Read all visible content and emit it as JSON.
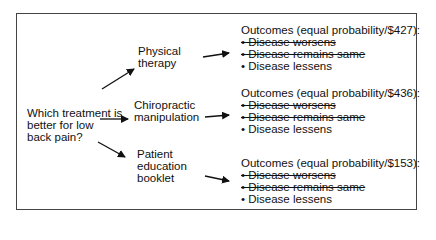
{
  "question": {
    "lines": [
      "Which treatment is",
      "better for low",
      "back pain?"
    ]
  },
  "options": [
    {
      "lines": [
        "Physical",
        "therapy"
      ],
      "outcomes": {
        "title": "Outcomes (equal probability/$427):",
        "items": [
          {
            "label": "• Disease worsens",
            "struck": true
          },
          {
            "label": "• Disease remains same",
            "struck": true
          },
          {
            "label": "• Disease lessens",
            "struck": false
          }
        ]
      }
    },
    {
      "lines": [
        "Chiropractic",
        "manipulation"
      ],
      "outcomes": {
        "title": "Outcomes (equal probability/$436):",
        "items": [
          {
            "label": "• Disease worsens",
            "struck": true
          },
          {
            "label": "• Disease remains same",
            "struck": true
          },
          {
            "label": "• Disease lessens",
            "struck": false
          }
        ]
      }
    },
    {
      "lines": [
        "Patient",
        "education",
        "booklet"
      ],
      "outcomes": {
        "title": "Outcomes (equal probability/$153):",
        "items": [
          {
            "label": "• Disease worsens",
            "struck": true
          },
          {
            "label": "• Disease remains same",
            "struck": true
          },
          {
            "label": "• Disease lessens",
            "struck": false
          }
        ]
      }
    }
  ],
  "colors": {
    "border": "#444444",
    "text": "#111111",
    "background": "#ffffff"
  }
}
